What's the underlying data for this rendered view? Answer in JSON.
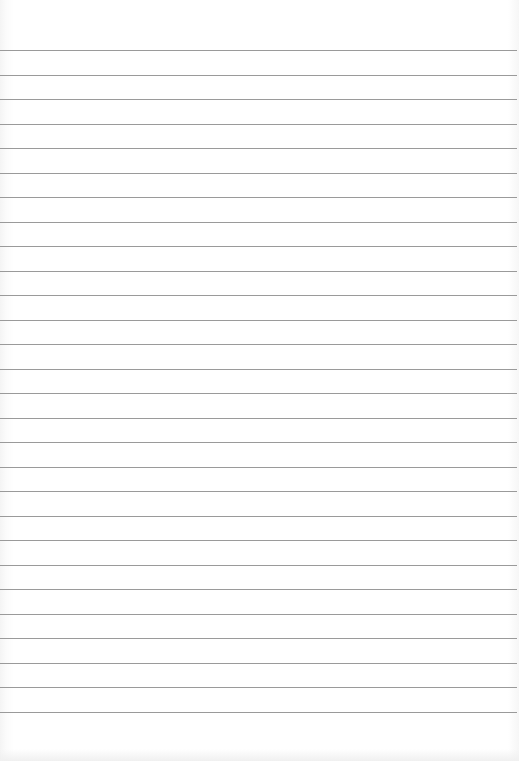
{
  "page": {
    "type": "lined-paper",
    "line_count": 28,
    "first_line_y": 50,
    "line_spacing": 24.5,
    "line_color": "#9a9a9a",
    "background_color": "#ffffff"
  }
}
